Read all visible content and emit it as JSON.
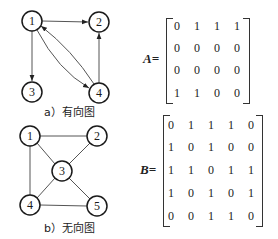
{
  "directed_graph": {
    "caption": "a）有向图",
    "nodes": [
      {
        "id": "1",
        "x": 32,
        "y": 21
      },
      {
        "id": "2",
        "x": 99,
        "y": 22
      },
      {
        "id": "3",
        "x": 32,
        "y": 92
      },
      {
        "id": "4",
        "x": 99,
        "y": 93
      }
    ],
    "edges": [
      {
        "from": "1",
        "to": "2"
      },
      {
        "from": "1",
        "to": "3"
      },
      {
        "from": "1",
        "to": "4"
      },
      {
        "from": "4",
        "to": "1"
      },
      {
        "from": "4",
        "to": "2"
      }
    ]
  },
  "undirected_graph": {
    "caption": "b）无向图",
    "nodes": [
      {
        "id": "1",
        "x": 30,
        "y": 136
      },
      {
        "id": "2",
        "x": 97,
        "y": 136
      },
      {
        "id": "3",
        "x": 62,
        "y": 171
      },
      {
        "id": "4",
        "x": 30,
        "y": 205
      },
      {
        "id": "5",
        "x": 97,
        "y": 206
      }
    ],
    "edges": [
      {
        "from": "1",
        "to": "2"
      },
      {
        "from": "1",
        "to": "3"
      },
      {
        "from": "1",
        "to": "4"
      },
      {
        "from": "2",
        "to": "3"
      },
      {
        "from": "3",
        "to": "4"
      },
      {
        "from": "3",
        "to": "5"
      },
      {
        "from": "4",
        "to": "5"
      }
    ]
  },
  "matrix_a": {
    "label": "A=",
    "rows": [
      [
        "0",
        "1",
        "1",
        "1"
      ],
      [
        "0",
        "0",
        "0",
        "0"
      ],
      [
        "0",
        "0",
        "0",
        "0"
      ],
      [
        "1",
        "1",
        "0",
        "0"
      ]
    ]
  },
  "matrix_b": {
    "label": "B=",
    "rows": [
      [
        "0",
        "1",
        "1",
        "1",
        "0"
      ],
      [
        "1",
        "0",
        "1",
        "0",
        "0"
      ],
      [
        "1",
        "1",
        "0",
        "1",
        "1"
      ],
      [
        "1",
        "0",
        "1",
        "0",
        "1"
      ],
      [
        "0",
        "0",
        "1",
        "1",
        "0"
      ]
    ]
  }
}
